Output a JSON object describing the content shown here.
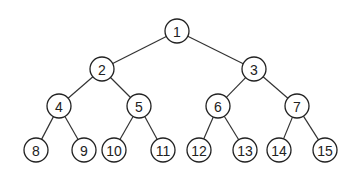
{
  "diagram": {
    "type": "binary-tree",
    "node_radius": 12,
    "colors": {
      "background": "#ffffff",
      "stroke": "#222222",
      "text": "#222222"
    },
    "nodes": [
      {
        "id": 1,
        "label": "1",
        "x": 177,
        "y": 31
      },
      {
        "id": 2,
        "label": "2",
        "x": 102,
        "y": 69
      },
      {
        "id": 3,
        "label": "3",
        "x": 254,
        "y": 69
      },
      {
        "id": 4,
        "label": "4",
        "x": 59,
        "y": 106
      },
      {
        "id": 5,
        "label": "5",
        "x": 139,
        "y": 106
      },
      {
        "id": 6,
        "label": "6",
        "x": 218,
        "y": 106
      },
      {
        "id": 7,
        "label": "7",
        "x": 297,
        "y": 106
      },
      {
        "id": 8,
        "label": "8",
        "x": 36,
        "y": 150
      },
      {
        "id": 9,
        "label": "9",
        "x": 84,
        "y": 150
      },
      {
        "id": 10,
        "label": "10",
        "x": 114,
        "y": 150
      },
      {
        "id": 11,
        "label": "11",
        "x": 163,
        "y": 150
      },
      {
        "id": 12,
        "label": "12",
        "x": 199,
        "y": 150
      },
      {
        "id": 13,
        "label": "13",
        "x": 245,
        "y": 150
      },
      {
        "id": 14,
        "label": "14",
        "x": 279,
        "y": 150
      },
      {
        "id": 15,
        "label": "15",
        "x": 325,
        "y": 150
      }
    ],
    "edges": [
      [
        1,
        2
      ],
      [
        1,
        3
      ],
      [
        2,
        4
      ],
      [
        2,
        5
      ],
      [
        3,
        6
      ],
      [
        3,
        7
      ],
      [
        4,
        8
      ],
      [
        4,
        9
      ],
      [
        5,
        10
      ],
      [
        5,
        11
      ],
      [
        6,
        12
      ],
      [
        6,
        13
      ],
      [
        7,
        14
      ],
      [
        7,
        15
      ]
    ]
  }
}
